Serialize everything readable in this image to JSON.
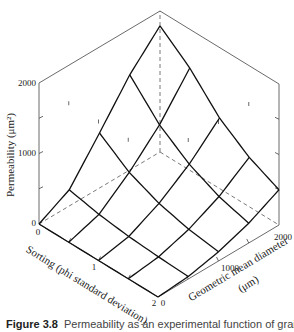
{
  "chart_data": {
    "type": "surface3d",
    "title": "",
    "zlabel": "Permeability (μm²)",
    "xlabel": "Sorting (phi standard deviation)",
    "ylabel": "Geometric mean diameter (μm)",
    "z_ticks": [
      "0",
      "1000",
      "2000"
    ],
    "z_range": [
      0,
      2000
    ],
    "x_ticks": [
      "0",
      "1",
      "2"
    ],
    "x_range": [
      0,
      2
    ],
    "y_ticks": [
      "0",
      "1000",
      "2000"
    ],
    "y_range": [
      0,
      2000
    ],
    "sorting": [
      0,
      0.5,
      1,
      1.5,
      2
    ],
    "diameter": [
      0,
      500,
      1000,
      1500,
      2000
    ],
    "permeability": [
      [
        0,
        230,
        780,
        1350,
        1790
      ],
      [
        0,
        140,
        480,
        900,
        1450
      ],
      [
        0,
        85,
        300,
        600,
        1000
      ],
      [
        0,
        55,
        190,
        400,
        700
      ],
      [
        0,
        35,
        130,
        280,
        500
      ]
    ],
    "grid": false,
    "legend": null
  },
  "labels": {
    "z_axis_title": "Permeability (μm²)",
    "z_tick_0": "0",
    "z_tick_1000": "1000",
    "z_tick_2000": "2000",
    "x_axis_title": "Sorting (phi standard deviation)",
    "x_tick_0": "0",
    "x_tick_1": "1",
    "x_tick_2": "2",
    "y_axis_title_line1": "Geometric mean diameter",
    "y_axis_title_line2": "(μm)",
    "y_tick_0": "0",
    "y_tick_1000": "1000",
    "y_tick_2000": "2000"
  },
  "caption": {
    "figure_number": "Figure 3.8",
    "text": "Permeability as an experimental function of grain"
  }
}
